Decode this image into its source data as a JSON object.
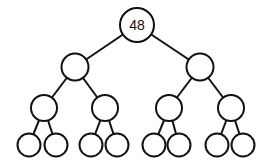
{
  "diagram": {
    "type": "binary-tree",
    "colors": {
      "stroke": "#111111",
      "fill": "#ffffff",
      "background": "#ffffff"
    },
    "nodes": [
      {
        "id": "n0",
        "x": 137,
        "y": 25,
        "r": 17,
        "label": "48"
      },
      {
        "id": "n1",
        "x": 75,
        "y": 67,
        "r": 13.5,
        "label": ""
      },
      {
        "id": "n2",
        "x": 200,
        "y": 67,
        "r": 13.5,
        "label": ""
      },
      {
        "id": "n3",
        "x": 44,
        "y": 108,
        "r": 13,
        "label": ""
      },
      {
        "id": "n4",
        "x": 105,
        "y": 108,
        "r": 13,
        "label": ""
      },
      {
        "id": "n5",
        "x": 169,
        "y": 108,
        "r": 13,
        "label": ""
      },
      {
        "id": "n6",
        "x": 231,
        "y": 108,
        "r": 13,
        "label": ""
      },
      {
        "id": "n7",
        "x": 29,
        "y": 145,
        "r": 11.5,
        "label": ""
      },
      {
        "id": "n8",
        "x": 56,
        "y": 145,
        "r": 11.5,
        "label": ""
      },
      {
        "id": "n9",
        "x": 91,
        "y": 145,
        "r": 11.5,
        "label": ""
      },
      {
        "id": "n10",
        "x": 117,
        "y": 145,
        "r": 11.5,
        "label": ""
      },
      {
        "id": "n11",
        "x": 154,
        "y": 145,
        "r": 11.5,
        "label": ""
      },
      {
        "id": "n12",
        "x": 179,
        "y": 145,
        "r": 11.5,
        "label": ""
      },
      {
        "id": "n13",
        "x": 217,
        "y": 145,
        "r": 11.5,
        "label": ""
      },
      {
        "id": "n14",
        "x": 243,
        "y": 145,
        "r": 11.5,
        "label": ""
      }
    ],
    "edges": [
      [
        "n0",
        "n1"
      ],
      [
        "n0",
        "n2"
      ],
      [
        "n1",
        "n3"
      ],
      [
        "n1",
        "n4"
      ],
      [
        "n2",
        "n5"
      ],
      [
        "n2",
        "n6"
      ],
      [
        "n3",
        "n7"
      ],
      [
        "n3",
        "n8"
      ],
      [
        "n4",
        "n9"
      ],
      [
        "n4",
        "n10"
      ],
      [
        "n5",
        "n11"
      ],
      [
        "n5",
        "n12"
      ],
      [
        "n6",
        "n13"
      ],
      [
        "n6",
        "n14"
      ]
    ]
  }
}
